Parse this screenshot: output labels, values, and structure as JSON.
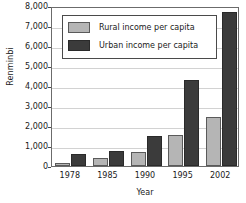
{
  "chart_data": {
    "type": "bar",
    "title": "",
    "xlabel": "Year",
    "ylabel": "Renminbi",
    "categories": [
      "1978",
      "1985",
      "1990",
      "1995",
      "2002"
    ],
    "series": [
      {
        "name": "Rural income per capita",
        "color": "#b5b5b5",
        "values": [
          170,
          400,
          700,
          1530,
          2450
        ]
      },
      {
        "name": "Urban income per capita",
        "color": "#3b3b3b",
        "values": [
          620,
          760,
          1490,
          4280,
          7700
        ]
      }
    ],
    "ylim": [
      0,
      8000
    ],
    "ytick_values": [
      0,
      1000,
      2000,
      3000,
      4000,
      5000,
      6000,
      7000,
      8000
    ],
    "ytick_labels": [
      "0",
      "1,000",
      "2,000",
      "3,000",
      "4,000",
      "5,000",
      "6,000",
      "7,000",
      "8,000"
    ],
    "grid": true,
    "legend_position": "top-left-inside"
  }
}
